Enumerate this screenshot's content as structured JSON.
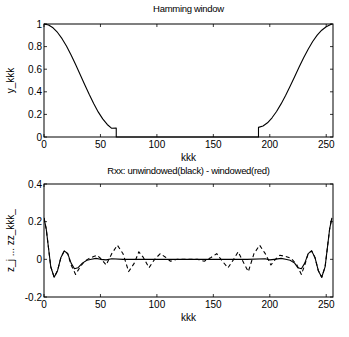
{
  "chart_data": [
    {
      "type": "line",
      "title": "Hamming window",
      "xlabel": "kkk",
      "ylabel": "y_kkk",
      "xlim": [
        0,
        256
      ],
      "ylim": [
        0,
        1
      ],
      "xticks": [
        0,
        50,
        100,
        150,
        200,
        250
      ],
      "yticks": [
        0,
        0.2,
        0.4,
        0.6,
        0.8,
        1
      ],
      "xtick_labels": [
        "0",
        "50",
        "100",
        "150",
        "200",
        "250"
      ],
      "ytick_labels": [
        "0",
        "0.2",
        "0.4",
        "0.6",
        "0.8",
        "1"
      ],
      "grid": false,
      "series": [
        {
          "name": "y_kkk",
          "style": "solid",
          "color": "#000000",
          "x": [
            0,
            4,
            8,
            12,
            16,
            20,
            24,
            28,
            32,
            36,
            40,
            44,
            48,
            52,
            56,
            60,
            64,
            64,
            190,
            190,
            194,
            198,
            202,
            206,
            210,
            214,
            218,
            222,
            226,
            230,
            234,
            238,
            242,
            246,
            250,
            254,
            255
          ],
          "y": [
            1.0,
            0.991,
            0.966,
            0.925,
            0.87,
            0.803,
            0.726,
            0.642,
            0.554,
            0.465,
            0.378,
            0.296,
            0.222,
            0.16,
            0.111,
            0.077,
            0.08,
            0.0,
            0.0,
            0.085,
            0.098,
            0.126,
            0.17,
            0.226,
            0.293,
            0.368,
            0.449,
            0.534,
            0.619,
            0.701,
            0.777,
            0.845,
            0.901,
            0.945,
            0.976,
            0.995,
            1.0
          ]
        }
      ]
    },
    {
      "type": "line",
      "title": "Rxx: unwindowed(black)   -   windowed(red)",
      "xlabel": "kkk",
      "ylabel": "z_j ...    zz_kkk_",
      "xlim": [
        0,
        256
      ],
      "ylim": [
        -0.2,
        0.4
      ],
      "xticks": [
        0,
        50,
        100,
        150,
        200,
        250
      ],
      "yticks": [
        -0.2,
        0,
        0.2,
        0.4
      ],
      "xtick_labels": [
        "0",
        "50",
        "100",
        "150",
        "200",
        "250"
      ],
      "ytick_labels": [
        "-0.2",
        "0",
        "0.2",
        "0.4"
      ],
      "grid": false,
      "series": [
        {
          "name": "unwindowed",
          "style": "solid",
          "color": "#000000",
          "x": [
            0,
            2,
            4,
            6,
            9,
            12,
            15,
            18,
            21,
            24,
            27,
            30,
            34,
            38,
            42,
            46,
            50,
            55,
            60,
            70,
            80,
            100,
            120,
            140,
            160,
            180,
            196,
            200,
            204,
            210,
            214,
            218,
            222,
            225,
            228,
            231,
            234,
            237,
            240,
            243,
            246,
            249,
            251,
            253,
            255
          ],
          "y": [
            0.22,
            0.16,
            0.06,
            -0.04,
            -0.095,
            -0.06,
            0.01,
            0.045,
            0.03,
            -0.02,
            -0.05,
            -0.045,
            -0.02,
            -0.005,
            0.0,
            0.005,
            0.0,
            -0.003,
            0.003,
            0.0,
            0.0,
            0.0,
            0.0,
            0.0,
            0.0,
            0.0,
            0.003,
            -0.003,
            0.0,
            0.005,
            0.0,
            -0.005,
            -0.02,
            -0.045,
            -0.05,
            -0.02,
            0.03,
            0.045,
            0.01,
            -0.06,
            -0.095,
            -0.04,
            0.06,
            0.16,
            0.22
          ]
        },
        {
          "name": "windowed",
          "style": "dashed",
          "color": "#000000",
          "x": [
            0,
            2,
            4,
            6,
            9,
            12,
            15,
            18,
            21,
            24,
            28,
            32,
            36,
            40,
            44,
            47,
            51,
            55,
            60,
            65,
            70,
            75,
            80,
            84,
            88,
            93,
            98,
            103,
            108,
            112,
            118,
            124,
            130,
            136,
            142,
            148,
            153,
            158,
            163,
            168,
            172,
            177,
            181,
            186,
            191,
            196,
            201,
            205,
            209,
            214,
            219,
            224,
            228,
            231,
            234,
            237,
            240,
            243,
            246,
            249,
            251,
            253,
            255
          ],
          "y": [
            0.22,
            0.16,
            0.06,
            -0.04,
            -0.095,
            -0.06,
            0.01,
            0.045,
            0.03,
            -0.03,
            -0.08,
            -0.04,
            -0.01,
            0.005,
            0.015,
            0.022,
            0.0,
            -0.03,
            0.03,
            0.075,
            0.03,
            -0.065,
            -0.02,
            0.04,
            0.01,
            -0.045,
            0.0,
            0.03,
            0.01,
            -0.01,
            0.0,
            0.0,
            0.0,
            0.0,
            -0.01,
            0.01,
            0.03,
            -0.01,
            -0.045,
            0.0,
            0.04,
            -0.02,
            -0.065,
            0.03,
            0.075,
            0.03,
            -0.03,
            0.0,
            0.022,
            0.015,
            0.005,
            -0.03,
            -0.08,
            -0.03,
            0.03,
            0.045,
            0.01,
            -0.06,
            -0.095,
            -0.04,
            0.06,
            0.16,
            0.22
          ]
        }
      ]
    }
  ]
}
